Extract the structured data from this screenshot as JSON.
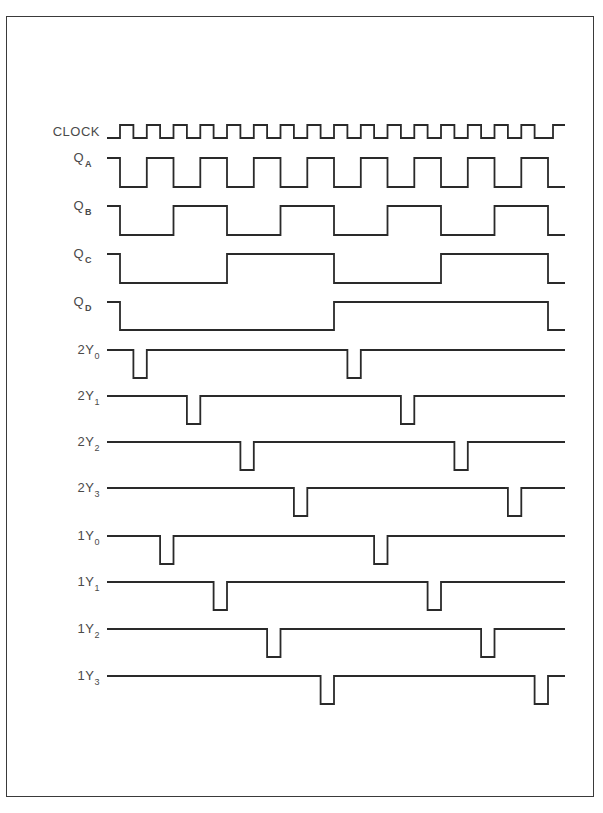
{
  "figure": {
    "title": ""
  },
  "timing": {
    "x_start": 107,
    "x_first_edge": 120,
    "period": 26.75,
    "cycles": 16,
    "x_end": 565,
    "line_color": "#2a2a2a",
    "label_color": "#4a4a4a"
  },
  "signals": [
    {
      "id": "clock",
      "label": "CLOCK",
      "sub": "",
      "y_high": 125,
      "y_low": 138,
      "type": "clock"
    },
    {
      "id": "qa",
      "label": "Q",
      "sub": "A",
      "y_high": 158,
      "y_low": 187,
      "type": "counter",
      "div": 1
    },
    {
      "id": "qb",
      "label": "Q",
      "sub": "B",
      "y_high": 206,
      "y_low": 235,
      "type": "counter",
      "div": 2
    },
    {
      "id": "qc",
      "label": "Q",
      "sub": "C",
      "y_high": 254,
      "y_low": 283,
      "type": "counter",
      "div": 4
    },
    {
      "id": "qd",
      "label": "Q",
      "sub": "D",
      "y_high": 302,
      "y_low": 330,
      "type": "counter",
      "div": 8
    },
    {
      "id": "2y0",
      "label": "2Y",
      "sub": "0",
      "y_high": 350,
      "y_low": 378,
      "type": "pulse",
      "cycle": 0
    },
    {
      "id": "2y1",
      "label": "2Y",
      "sub": "1",
      "y_high": 396,
      "y_low": 424,
      "type": "pulse",
      "cycle": 2
    },
    {
      "id": "2y2",
      "label": "2Y",
      "sub": "2",
      "y_high": 442,
      "y_low": 470,
      "type": "pulse",
      "cycle": 4
    },
    {
      "id": "2y3",
      "label": "2Y",
      "sub": "3",
      "y_high": 488,
      "y_low": 516,
      "type": "pulse",
      "cycle": 6
    },
    {
      "id": "1y0",
      "label": "1Y",
      "sub": "0",
      "y_high": 536,
      "y_low": 564,
      "type": "pulse",
      "cycle": 1
    },
    {
      "id": "1y1",
      "label": "1Y",
      "sub": "1",
      "y_high": 582,
      "y_low": 610,
      "type": "pulse",
      "cycle": 3
    },
    {
      "id": "1y2",
      "label": "1Y",
      "sub": "2",
      "y_high": 629,
      "y_low": 657,
      "type": "pulse",
      "cycle": 5
    },
    {
      "id": "1y3",
      "label": "1Y",
      "sub": "3",
      "y_high": 676,
      "y_low": 704,
      "type": "pulse",
      "cycle": 7
    }
  ]
}
